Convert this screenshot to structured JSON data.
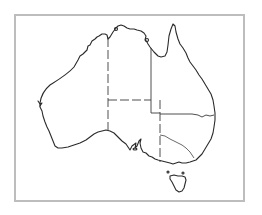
{
  "map": {
    "subject": "Australia outline map",
    "style": "black outline on white, state borders",
    "frame_color": "#bdbdbd",
    "line_color": "#2a2a2a",
    "regions": [
      {
        "id": "western-australia"
      },
      {
        "id": "northern-territory"
      },
      {
        "id": "south-australia"
      },
      {
        "id": "queensland"
      },
      {
        "id": "new-south-wales"
      },
      {
        "id": "victoria"
      },
      {
        "id": "tasmania"
      }
    ]
  }
}
